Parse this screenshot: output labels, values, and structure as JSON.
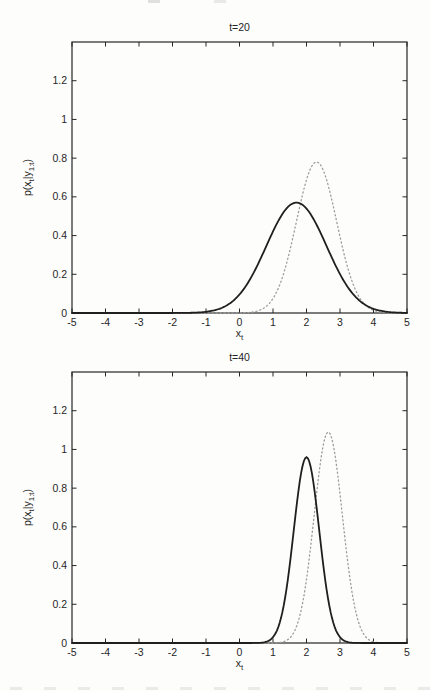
{
  "figure": {
    "background_color": "#fdfdfc",
    "axis_color": "#262626",
    "text_color": "#262626"
  },
  "chart_data": [
    {
      "type": "line",
      "title": "t=20",
      "xlabel": "x_t",
      "xlabel_parts": [
        {
          "t": "x",
          "sub": false
        },
        {
          "t": "t",
          "sub": true
        }
      ],
      "ylabel": "p(x_t|y_1:t)",
      "ylabel_parts": [
        {
          "t": "p(x",
          "sub": false
        },
        {
          "t": "t",
          "sub": true
        },
        {
          "t": "|y",
          "sub": false
        },
        {
          "t": "1:t",
          "sub": true
        },
        {
          "t": ")",
          "sub": false
        }
      ],
      "xlim": [
        -5,
        5
      ],
      "ylim": [
        0,
        1.4
      ],
      "xticks": [
        -5,
        -4,
        -3,
        -2,
        -1,
        0,
        1,
        2,
        3,
        4,
        5
      ],
      "xtick_labels": [
        "-5",
        "-4",
        "-3",
        "-2",
        "-1",
        "0",
        "1",
        "2",
        "3",
        "4",
        "5"
      ],
      "yticks": [
        0,
        0.2,
        0.4,
        0.6,
        0.8,
        1,
        1.2
      ],
      "ytick_labels": [
        "0",
        "0.2",
        "0.4",
        "0.6",
        "0.8",
        "1",
        "1.2"
      ],
      "grid": false,
      "legend": null,
      "series": [
        {
          "name": "solid-posterior",
          "line_style": "solid",
          "color": "#1f1f1f",
          "curve": "gaussian",
          "mean": 1.7,
          "sigma": 0.9,
          "amplitude": 0.57,
          "peak": {
            "x": 1.7,
            "y": 0.57
          },
          "visible_support": [
            -0.8,
            4.0
          ]
        },
        {
          "name": "dotted-posterior",
          "line_style": "dotted",
          "color": "#9d9d9d",
          "curve": "gaussian",
          "mean": 2.3,
          "sigma": 0.6,
          "amplitude": 0.78,
          "peak": {
            "x": 2.3,
            "y": 0.78
          },
          "visible_support": [
            0.6,
            3.9
          ]
        }
      ]
    },
    {
      "type": "line",
      "title": "t=40",
      "xlabel": "x_t",
      "xlabel_parts": [
        {
          "t": "x",
          "sub": false
        },
        {
          "t": "t",
          "sub": true
        }
      ],
      "ylabel": "p(x_t|y_1:t)",
      "ylabel_parts": [
        {
          "t": "p(x",
          "sub": false
        },
        {
          "t": "t",
          "sub": true
        },
        {
          "t": "|y",
          "sub": false
        },
        {
          "t": "1:t",
          "sub": true
        },
        {
          "t": ")",
          "sub": false
        }
      ],
      "xlim": [
        -5,
        5
      ],
      "ylim": [
        0,
        1.4
      ],
      "xticks": [
        -5,
        -4,
        -3,
        -2,
        -1,
        0,
        1,
        2,
        3,
        4,
        5
      ],
      "xtick_labels": [
        "-5",
        "-4",
        "-3",
        "-2",
        "-1",
        "0",
        "1",
        "2",
        "3",
        "4",
        "5"
      ],
      "yticks": [
        0,
        0.2,
        0.4,
        0.6,
        0.8,
        1,
        1.2
      ],
      "ytick_labels": [
        "0",
        "0.2",
        "0.4",
        "0.6",
        "0.8",
        "1",
        "1.2"
      ],
      "grid": false,
      "legend": null,
      "series": [
        {
          "name": "solid-posterior",
          "line_style": "solid",
          "color": "#1f1f1f",
          "curve": "gaussian",
          "mean": 2.0,
          "sigma": 0.38,
          "amplitude": 0.96,
          "peak": {
            "x": 2.0,
            "y": 0.96
          },
          "visible_support": [
            0.9,
            3.4
          ]
        },
        {
          "name": "dotted-posterior",
          "line_style": "dotted",
          "color": "#9d9d9d",
          "curve": "gaussian",
          "mean": 2.65,
          "sigma": 0.42,
          "amplitude": 1.09,
          "peak": {
            "x": 2.65,
            "y": 1.09
          },
          "visible_support": [
            1.5,
            4.0
          ]
        }
      ]
    }
  ]
}
